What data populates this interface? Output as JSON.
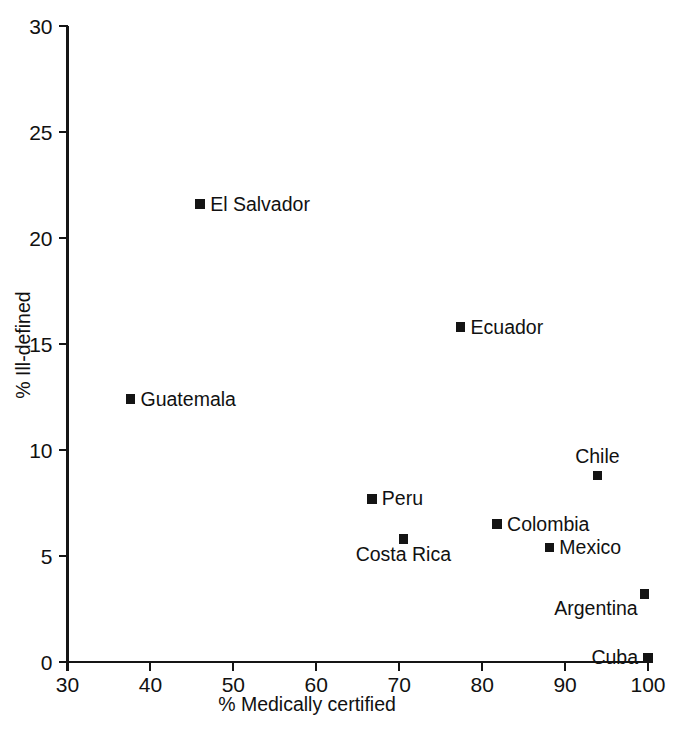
{
  "chart_data": {
    "type": "scatter",
    "title": "",
    "xlabel": "% Medically certified",
    "ylabel": "% Ill-defined",
    "xlim": [
      30,
      100
    ],
    "ylim": [
      0,
      30
    ],
    "xticks": [
      30,
      40,
      50,
      60,
      70,
      80,
      90,
      100
    ],
    "yticks": [
      0,
      5,
      10,
      15,
      20,
      25,
      30
    ],
    "xtick_labels": [
      "30",
      "40",
      "50",
      "60",
      "70",
      "80",
      "90",
      "100"
    ],
    "ytick_labels": [
      "0",
      "5",
      "10",
      "15",
      "20",
      "25",
      "30"
    ],
    "grid": false,
    "legend": false,
    "marker_color": "#141414",
    "marker_shape": "square",
    "points": [
      {
        "label": "El Salvador",
        "x": 46.0,
        "y": 21.6,
        "label_pos": "right"
      },
      {
        "label": "Ecuador",
        "x": 77.4,
        "y": 15.8,
        "label_pos": "right"
      },
      {
        "label": "Guatemala",
        "x": 37.6,
        "y": 12.4,
        "label_pos": "right"
      },
      {
        "label": "Chile",
        "x": 93.9,
        "y": 8.8,
        "label_pos": "above"
      },
      {
        "label": "Peru",
        "x": 66.7,
        "y": 7.7,
        "label_pos": "right"
      },
      {
        "label": "Colombia",
        "x": 81.8,
        "y": 6.5,
        "label_pos": "right"
      },
      {
        "label": "Costa Rica",
        "x": 70.5,
        "y": 5.8,
        "label_pos": "below"
      },
      {
        "label": "Mexico",
        "x": 88.1,
        "y": 5.4,
        "label_pos": "right"
      },
      {
        "label": "Argentina",
        "x": 99.6,
        "y": 3.2,
        "label_pos": "belowleft"
      },
      {
        "label": "Cuba",
        "x": 100.0,
        "y": 0.2,
        "label_pos": "left"
      }
    ]
  },
  "axes": {
    "x_title": "% Medically certified",
    "y_title": "% Ill-defined",
    "x_labels": [
      "30",
      "40",
      "50",
      "60",
      "70",
      "80",
      "90",
      "100"
    ],
    "y_labels": [
      "0",
      "5",
      "10",
      "15",
      "20",
      "25",
      "30"
    ]
  },
  "series_labels": [
    "El Salvador",
    "Ecuador",
    "Guatemala",
    "Chile",
    "Peru",
    "Colombia",
    "Costa Rica",
    "Mexico",
    "Argentina",
    "Cuba"
  ]
}
